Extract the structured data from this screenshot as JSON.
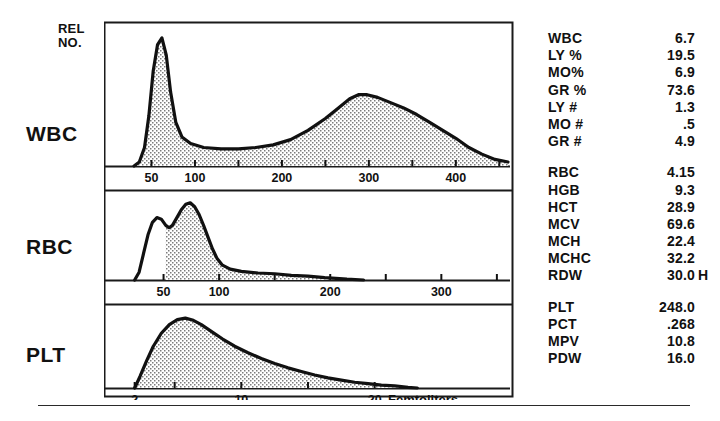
{
  "axes": {
    "y_axis_label": "REL\nNO.",
    "x_axis_unit_label": "Femtoliters"
  },
  "panels": [
    {
      "id": "wbc",
      "row_label": "WBC",
      "x_min": 0,
      "x_max": 460,
      "ticks": [
        50,
        100,
        150,
        200,
        250,
        300,
        350,
        400,
        450
      ],
      "tick_labels": [
        {
          "value": 50,
          "text": "50"
        },
        {
          "value": 100,
          "text": "100"
        },
        {
          "value": 200,
          "text": "200"
        },
        {
          "value": 300,
          "text": "300"
        },
        {
          "value": 400,
          "text": "400"
        }
      ],
      "fill_start": 30,
      "curve": [
        [
          30,
          0.0
        ],
        [
          36,
          0.03
        ],
        [
          42,
          0.14
        ],
        [
          47,
          0.38
        ],
        [
          52,
          0.72
        ],
        [
          57,
          0.92
        ],
        [
          62,
          0.97
        ],
        [
          67,
          0.84
        ],
        [
          72,
          0.56
        ],
        [
          78,
          0.33
        ],
        [
          85,
          0.22
        ],
        [
          95,
          0.17
        ],
        [
          110,
          0.14
        ],
        [
          130,
          0.13
        ],
        [
          150,
          0.13
        ],
        [
          170,
          0.14
        ],
        [
          190,
          0.16
        ],
        [
          210,
          0.2
        ],
        [
          230,
          0.27
        ],
        [
          250,
          0.36
        ],
        [
          265,
          0.44
        ],
        [
          278,
          0.51
        ],
        [
          288,
          0.54
        ],
        [
          298,
          0.54
        ],
        [
          310,
          0.52
        ],
        [
          325,
          0.48
        ],
        [
          340,
          0.44
        ],
        [
          355,
          0.39
        ],
        [
          370,
          0.33
        ],
        [
          385,
          0.27
        ],
        [
          400,
          0.21
        ],
        [
          415,
          0.14
        ],
        [
          430,
          0.09
        ],
        [
          445,
          0.05
        ],
        [
          460,
          0.03
        ]
      ]
    },
    {
      "id": "rbc",
      "row_label": "RBC",
      "x_min": 0,
      "x_max": 360,
      "ticks": [
        50,
        100,
        150,
        200,
        250,
        300,
        350
      ],
      "tick_labels": [
        {
          "value": 50,
          "text": "50"
        },
        {
          "value": 100,
          "text": "100"
        },
        {
          "value": 200,
          "text": "200"
        },
        {
          "value": 300,
          "text": "300"
        }
      ],
      "fill_start": 50,
      "curve": [
        [
          24,
          0.0
        ],
        [
          28,
          0.1
        ],
        [
          32,
          0.34
        ],
        [
          36,
          0.58
        ],
        [
          40,
          0.74
        ],
        [
          44,
          0.8
        ],
        [
          48,
          0.78
        ],
        [
          52,
          0.7
        ],
        [
          55,
          0.67
        ],
        [
          58,
          0.7
        ],
        [
          62,
          0.8
        ],
        [
          66,
          0.9
        ],
        [
          70,
          0.97
        ],
        [
          74,
          0.99
        ],
        [
          78,
          0.94
        ],
        [
          82,
          0.84
        ],
        [
          86,
          0.7
        ],
        [
          90,
          0.55
        ],
        [
          94,
          0.4
        ],
        [
          98,
          0.28
        ],
        [
          103,
          0.19
        ],
        [
          110,
          0.14
        ],
        [
          120,
          0.11
        ],
        [
          135,
          0.09
        ],
        [
          150,
          0.08
        ],
        [
          165,
          0.06
        ],
        [
          180,
          0.05
        ],
        [
          195,
          0.03
        ],
        [
          205,
          0.02
        ],
        [
          215,
          0.01
        ],
        [
          230,
          0.0
        ]
      ]
    },
    {
      "id": "plt",
      "row_label": "PLT",
      "x_min": 0,
      "x_max": 30,
      "ticks": [
        2,
        5,
        10,
        15,
        20
      ],
      "tick_labels": [
        {
          "value": 2,
          "text": "2"
        },
        {
          "value": 10,
          "text": "10"
        },
        {
          "value": 20,
          "text": "20"
        }
      ],
      "fill_start": 2,
      "curve": [
        [
          2.0,
          0.0
        ],
        [
          2.4,
          0.16
        ],
        [
          2.9,
          0.38
        ],
        [
          3.4,
          0.58
        ],
        [
          4.0,
          0.76
        ],
        [
          4.6,
          0.88
        ],
        [
          5.2,
          0.95
        ],
        [
          5.8,
          0.97
        ],
        [
          6.4,
          0.94
        ],
        [
          7.0,
          0.88
        ],
        [
          7.8,
          0.78
        ],
        [
          8.6,
          0.68
        ],
        [
          9.5,
          0.58
        ],
        [
          10.5,
          0.49
        ],
        [
          11.5,
          0.41
        ],
        [
          12.5,
          0.34
        ],
        [
          13.5,
          0.28
        ],
        [
          14.5,
          0.23
        ],
        [
          15.5,
          0.18
        ],
        [
          16.5,
          0.14
        ],
        [
          17.5,
          0.11
        ],
        [
          18.5,
          0.08
        ],
        [
          19.5,
          0.06
        ],
        [
          20.5,
          0.04
        ],
        [
          21.5,
          0.03
        ],
        [
          22.5,
          0.01
        ],
        [
          23.2,
          0.0
        ]
      ]
    }
  ],
  "results": [
    {
      "group": "wbc-differential",
      "rows": [
        {
          "label": "WBC",
          "value": "6.7",
          "flag": ""
        },
        {
          "label": "LY %",
          "value": "19.5",
          "flag": ""
        },
        {
          "label": "MO%",
          "value": "6.9",
          "flag": ""
        },
        {
          "label": "GR %",
          "value": "73.6",
          "flag": ""
        },
        {
          "label": "LY #",
          "value": "1.3",
          "flag": ""
        },
        {
          "label": "MO #",
          "value": ".5",
          "flag": ""
        },
        {
          "label": "GR #",
          "value": "4.9",
          "flag": ""
        }
      ]
    },
    {
      "group": "rbc-indices",
      "rows": [
        {
          "label": "RBC",
          "value": "4.15",
          "flag": ""
        },
        {
          "label": "HGB",
          "value": "9.3",
          "flag": ""
        },
        {
          "label": "HCT",
          "value": "28.9",
          "flag": ""
        },
        {
          "label": "MCV",
          "value": "69.6",
          "flag": ""
        },
        {
          "label": "MCH",
          "value": "22.4",
          "flag": ""
        },
        {
          "label": "MCHC",
          "value": "32.2",
          "flag": ""
        },
        {
          "label": "RDW",
          "value": "30.0",
          "flag": "H"
        }
      ]
    },
    {
      "group": "platelet-indices",
      "rows": [
        {
          "label": "PLT",
          "value": "248.0",
          "flag": ""
        },
        {
          "label": "PCT",
          "value": ".268",
          "flag": ""
        },
        {
          "label": "MPV",
          "value": "10.8",
          "flag": ""
        },
        {
          "label": "PDW",
          "value": "16.0",
          "flag": ""
        }
      ]
    }
  ],
  "chart_data": {
    "type": "area",
    "title": "",
    "xlabel": "Femtoliters",
    "ylabel": "REL NO.",
    "grid": false,
    "legend": "none",
    "charts": [
      {
        "name": "WBC",
        "xlim": [
          0,
          460
        ],
        "ylim": [
          0,
          1
        ],
        "x": [
          30,
          36,
          42,
          47,
          52,
          57,
          62,
          67,
          72,
          78,
          85,
          95,
          110,
          130,
          150,
          170,
          190,
          210,
          230,
          250,
          265,
          278,
          288,
          298,
          310,
          325,
          340,
          355,
          370,
          385,
          400,
          415,
          430,
          445,
          460
        ],
        "y": [
          0.0,
          0.03,
          0.14,
          0.38,
          0.72,
          0.92,
          0.97,
          0.84,
          0.56,
          0.33,
          0.22,
          0.17,
          0.14,
          0.13,
          0.13,
          0.14,
          0.16,
          0.2,
          0.27,
          0.36,
          0.44,
          0.51,
          0.54,
          0.54,
          0.52,
          0.48,
          0.44,
          0.39,
          0.33,
          0.27,
          0.21,
          0.14,
          0.09,
          0.05,
          0.03
        ],
        "peaks": [
          {
            "label": "lymphocyte",
            "x": 62
          },
          {
            "label": "granulocyte",
            "x": 293
          }
        ]
      },
      {
        "name": "RBC",
        "xlim": [
          0,
          360
        ],
        "ylim": [
          0,
          1
        ],
        "x": [
          24,
          28,
          32,
          36,
          40,
          44,
          48,
          52,
          55,
          58,
          62,
          66,
          70,
          74,
          78,
          82,
          86,
          90,
          94,
          98,
          103,
          110,
          120,
          135,
          150,
          165,
          180,
          195,
          205,
          215,
          230
        ],
        "y": [
          0.0,
          0.1,
          0.34,
          0.58,
          0.74,
          0.8,
          0.78,
          0.7,
          0.67,
          0.7,
          0.8,
          0.9,
          0.97,
          0.99,
          0.94,
          0.84,
          0.7,
          0.55,
          0.4,
          0.28,
          0.19,
          0.14,
          0.11,
          0.09,
          0.08,
          0.06,
          0.05,
          0.03,
          0.02,
          0.01,
          0.0
        ],
        "peaks": [
          {
            "label": "shoulder",
            "x": 44
          },
          {
            "label": "main",
            "x": 74
          }
        ]
      },
      {
        "name": "PLT",
        "xlim": [
          0,
          30
        ],
        "ylim": [
          0,
          1
        ],
        "x": [
          2.0,
          2.4,
          2.9,
          3.4,
          4.0,
          4.6,
          5.2,
          5.8,
          6.4,
          7.0,
          7.8,
          8.6,
          9.5,
          10.5,
          11.5,
          12.5,
          13.5,
          14.5,
          15.5,
          16.5,
          17.5,
          18.5,
          19.5,
          20.5,
          21.5,
          22.5,
          23.2
        ],
        "y": [
          0.0,
          0.16,
          0.38,
          0.58,
          0.76,
          0.88,
          0.95,
          0.97,
          0.94,
          0.88,
          0.78,
          0.68,
          0.58,
          0.49,
          0.41,
          0.34,
          0.28,
          0.23,
          0.18,
          0.14,
          0.11,
          0.08,
          0.06,
          0.04,
          0.03,
          0.01,
          0.0
        ],
        "peaks": [
          {
            "label": "main",
            "x": 5.8
          }
        ]
      }
    ]
  }
}
